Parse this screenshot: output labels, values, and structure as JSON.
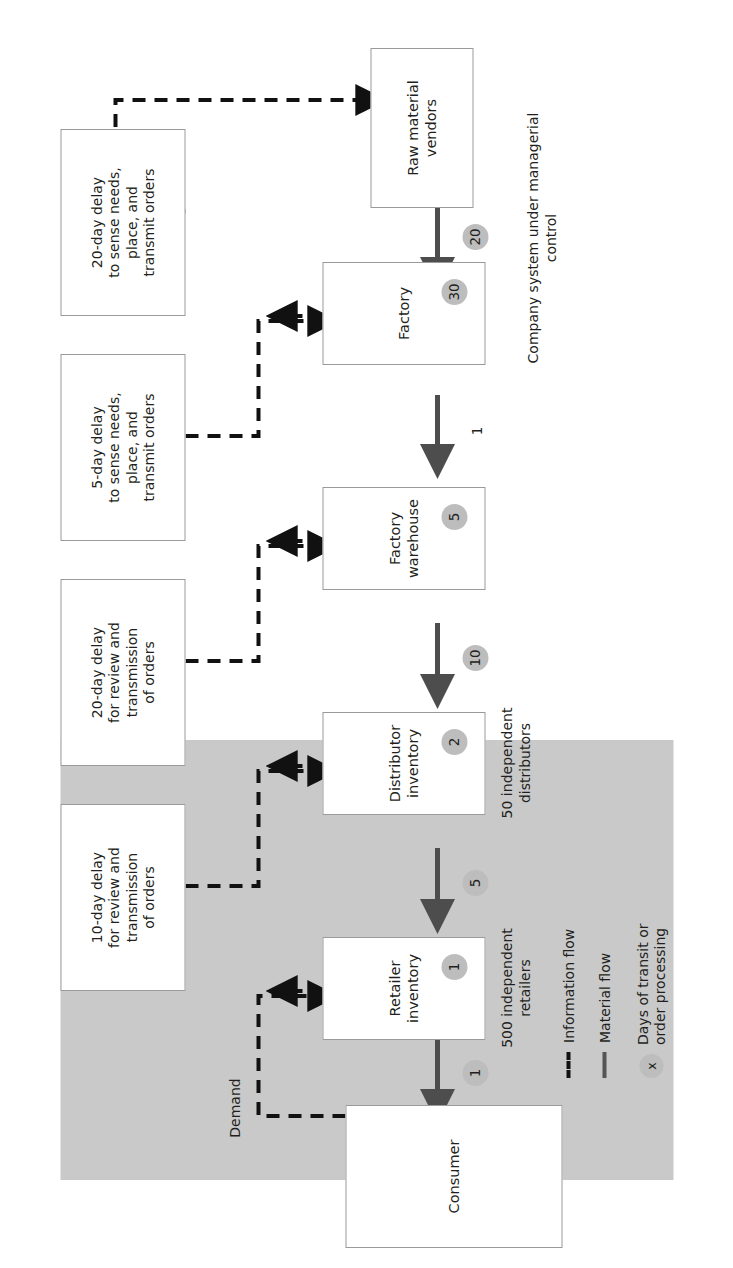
{
  "figure": {
    "region_label": "Company system under managerial\ncontrol"
  },
  "nodes": {
    "consumer": {
      "label": "Consumer"
    },
    "retailer_inventory": {
      "label": "Retailer\ninventory",
      "badge": "1",
      "note": "500 independent\nretailers"
    },
    "distributor_inventory": {
      "label": "Distributor\ninventory",
      "badge": "2",
      "note": "50 independent\ndistributors"
    },
    "factory_warehouse": {
      "label": "Factory\nwarehouse",
      "badge": "5"
    },
    "factory": {
      "label": "Factory",
      "badge": "30"
    },
    "raw_material_vendors": {
      "label": "Raw material\nvendors"
    },
    "delay_retailer": {
      "label": "10-day delay\nfor review and\ntransmission\nof orders"
    },
    "delay_distributor": {
      "label": "20-day delay\nfor review and\ntransmission\nof orders"
    },
    "delay_warehouse": {
      "label": "5-day delay\nto sense needs,\nplace, and\ntransmit orders"
    },
    "delay_factory": {
      "label": "20-day delay\nto sense needs,\nplace, and\ntransmit orders"
    }
  },
  "flow_badges": {
    "consumer_shipment": "1",
    "retailer_shipment": "5",
    "distributor_shipment": "10",
    "warehouse_shipment": "1",
    "vendor_shipment": "20"
  },
  "edge_labels": {
    "demand": "Demand"
  },
  "legend": {
    "items": [
      {
        "key": "information-flow",
        "label": "Information flow",
        "style": "dashed"
      },
      {
        "key": "material-flow",
        "label": "Material flow",
        "style": "solid"
      },
      {
        "key": "transit-days",
        "label": "Days of transit or\norder processing",
        "style": "circle",
        "glyph": "x"
      }
    ]
  },
  "colors": {
    "band": "#c9c9c9",
    "badge": "#bdbdbd",
    "material_flow": "#4d4d4d",
    "information_flow": "#111111",
    "box_border": "#9a9a9a",
    "text": "#231f20"
  }
}
